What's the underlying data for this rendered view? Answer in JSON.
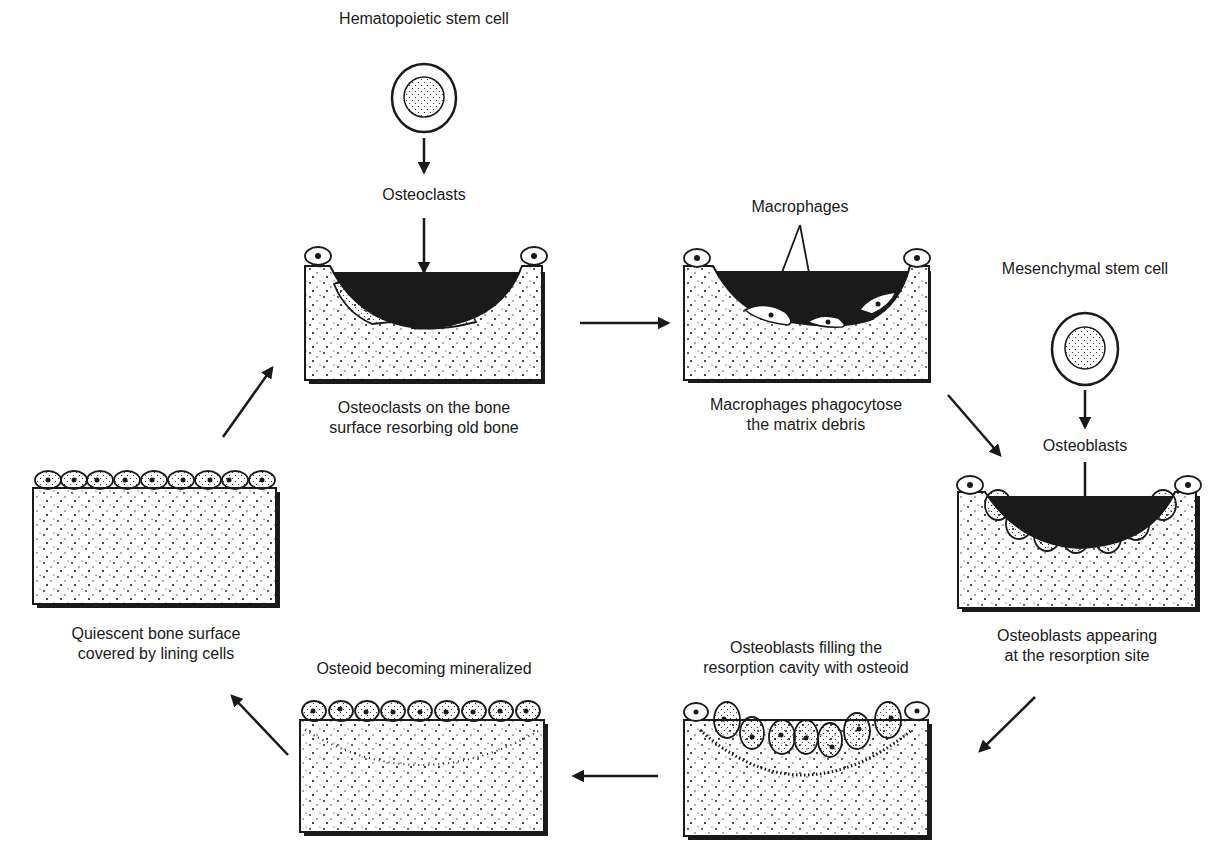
{
  "diagram": {
    "colors": {
      "ink": "#1a1a1a",
      "background": "#ffffff"
    },
    "labels": {
      "hsc": "Hematopoietic stem cell",
      "osteoclasts": "Osteoclasts",
      "macrophages": "Macrophages",
      "msc": "Mesenchymal stem cell",
      "osteoblasts": "Osteoblasts"
    },
    "stages": [
      {
        "id": "resorption",
        "caption_line1": "Osteoclasts on the bone",
        "caption_line2": "surface resorbing old bone"
      },
      {
        "id": "reversal",
        "caption_line1": "Macrophages phagocytose",
        "caption_line2": "the matrix debris"
      },
      {
        "id": "osteoblast-recruitment",
        "caption_line1": "Osteoblasts appearing",
        "caption_line2": "at the resorption site"
      },
      {
        "id": "formation",
        "caption_line1": "Osteoblasts filling the",
        "caption_line2": "resorption cavity with osteoid"
      },
      {
        "id": "mineralization",
        "caption_line1": "Osteoid becoming mineralized"
      },
      {
        "id": "quiescent",
        "caption_line1": "Quiescent bone surface",
        "caption_line2": "covered by lining cells"
      }
    ],
    "flow": [
      "resorption",
      "reversal",
      "osteoblast-recruitment",
      "formation",
      "mineralization",
      "quiescent",
      "resorption"
    ]
  }
}
